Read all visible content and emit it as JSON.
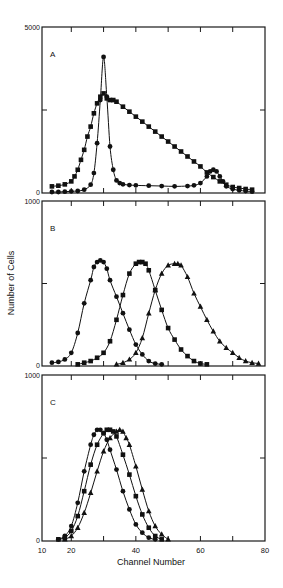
{
  "chart_data": {
    "type": "line",
    "xlabel": "Channel Number",
    "ylabel": "Number of Cells",
    "xlim": [
      10,
      80
    ],
    "x_ticks": [
      10,
      20,
      40,
      60,
      80
    ],
    "x_minor_ticks": [
      20,
      30,
      40,
      50,
      60,
      70
    ],
    "panels": [
      {
        "label": "A",
        "ylim": [
          0,
          5000
        ],
        "y_tick_labels": [
          "5000",
          "0"
        ],
        "y_mid_tick": 2500,
        "series": [
          {
            "marker": "circle",
            "x": [
              14,
              16,
              18,
              20,
              22,
              24,
              26,
              27,
              28,
              29,
              30,
              31,
              32,
              33,
              34,
              35,
              36,
              38,
              40,
              44,
              48,
              52,
              56,
              58,
              60,
              62,
              63,
              64,
              65,
              66,
              67,
              68,
              70,
              72,
              74,
              76
            ],
            "y": [
              30,
              30,
              40,
              50,
              60,
              100,
              250,
              600,
              1500,
              2800,
              4100,
              2900,
              1400,
              700,
              380,
              300,
              260,
              240,
              230,
              220,
              210,
              200,
              210,
              230,
              300,
              500,
              650,
              700,
              650,
              500,
              350,
              200,
              120,
              80,
              60,
              40
            ]
          },
          {
            "marker": "square",
            "x": [
              14,
              16,
              18,
              20,
              21,
              22,
              23,
              24,
              25,
              26,
              27,
              28,
              29,
              30,
              31,
              32,
              33,
              34,
              36,
              38,
              40,
              42,
              44,
              46,
              48,
              50,
              52,
              54,
              56,
              58,
              60,
              62,
              64,
              66,
              68,
              70,
              72,
              74,
              76
            ],
            "y": [
              200,
              220,
              260,
              350,
              500,
              700,
              1000,
              1300,
              1700,
              2000,
              2400,
              2700,
              2900,
              3000,
              2850,
              2800,
              2800,
              2750,
              2600,
              2450,
              2300,
              2150,
              2000,
              1850,
              1700,
              1550,
              1400,
              1250,
              1100,
              950,
              800,
              620,
              480,
              350,
              250,
              180,
              150,
              120,
              100
            ]
          }
        ]
      },
      {
        "label": "B",
        "ylim": [
          0,
          1000
        ],
        "y_tick_labels": [
          "1000",
          "0"
        ],
        "y_mid_tick": 500,
        "series": [
          {
            "marker": "circle",
            "x": [
              14,
              16,
              18,
              20,
              22,
              24,
              26,
              27,
              28,
              29,
              30,
              31,
              32,
              34,
              36,
              38,
              40,
              42,
              44,
              46,
              48
            ],
            "y": [
              20,
              25,
              40,
              80,
              200,
              380,
              520,
              600,
              630,
              640,
              630,
              590,
              520,
              420,
              320,
              220,
              130,
              70,
              30,
              15,
              10
            ]
          },
          {
            "marker": "square",
            "x": [
              22,
              24,
              26,
              28,
              30,
              32,
              34,
              36,
              38,
              40,
              41,
              42,
              43,
              44,
              46,
              48,
              50,
              52,
              54,
              56,
              58,
              60,
              62
            ],
            "y": [
              10,
              20,
              30,
              50,
              80,
              150,
              280,
              430,
              560,
              620,
              630,
              630,
              620,
              580,
              460,
              340,
              230,
              160,
              100,
              60,
              30,
              15,
              10
            ]
          },
          {
            "marker": "triangle",
            "x": [
              34,
              36,
              38,
              40,
              42,
              44,
              46,
              48,
              50,
              52,
              53,
              54,
              56,
              58,
              60,
              62,
              64,
              66,
              68,
              70,
              72,
              74,
              76,
              78
            ],
            "y": [
              10,
              20,
              40,
              80,
              170,
              320,
              460,
              560,
              610,
              620,
              620,
              610,
              540,
              440,
              360,
              280,
              210,
              150,
              110,
              80,
              50,
              30,
              20,
              15
            ]
          }
        ]
      },
      {
        "label": "C",
        "ylim": [
          0,
          1000
        ],
        "y_tick_labels": [
          "1000",
          "0"
        ],
        "y_mid_tick": 500,
        "series": [
          {
            "marker": "circle",
            "x": [
              16,
              18,
              20,
              22,
              24,
              26,
              27,
              28,
              29,
              30,
              31,
              32,
              34,
              36,
              38,
              40,
              42,
              44,
              46
            ],
            "y": [
              10,
              30,
              90,
              230,
              420,
              580,
              640,
              670,
              670,
              650,
              610,
              550,
              430,
              300,
              190,
              100,
              50,
              20,
              10
            ]
          },
          {
            "marker": "square",
            "x": [
              16,
              18,
              20,
              22,
              24,
              26,
              28,
              30,
              31,
              32,
              33,
              34,
              36,
              38,
              40,
              42,
              44,
              46,
              48
            ],
            "y": [
              10,
              20,
              60,
              150,
              300,
              460,
              580,
              650,
              670,
              670,
              660,
              630,
              520,
              400,
              270,
              160,
              80,
              30,
              10
            ]
          },
          {
            "marker": "triangle",
            "x": [
              18,
              20,
              22,
              24,
              26,
              28,
              30,
              32,
              34,
              35,
              36,
              37,
              38,
              40,
              42,
              44,
              46,
              48,
              50
            ],
            "y": [
              10,
              30,
              80,
              170,
              290,
              420,
              540,
              620,
              660,
              670,
              660,
              620,
              580,
              450,
              310,
              180,
              90,
              40,
              10
            ]
          }
        ]
      }
    ]
  },
  "figure": {
    "x_axis_label": "Channel Number",
    "y_axis_label": "Number of Cells",
    "x_tick_labels": [
      "10",
      "20",
      "40",
      "60",
      "80"
    ]
  }
}
